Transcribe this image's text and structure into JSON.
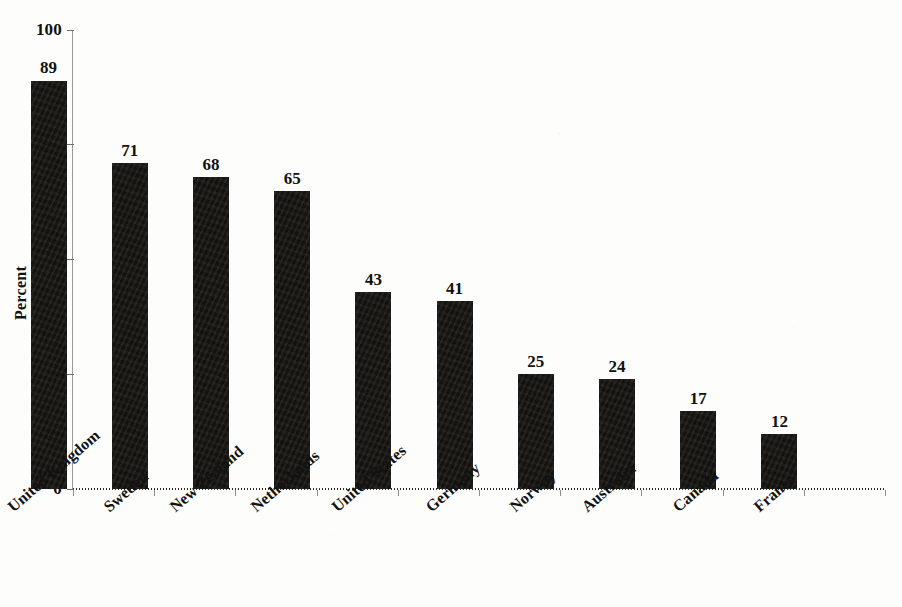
{
  "chart_data": {
    "type": "bar",
    "title": "",
    "subtitle": "",
    "xlabel": "",
    "ylabel": "Percent",
    "ylim": [
      0,
      100
    ],
    "grid": false,
    "legend": null,
    "orientation": "vertical",
    "bar_color": "#14120f",
    "categories": [
      "United Kingdom",
      "Sweden",
      "New Zealand",
      "Netherlands",
      "United States",
      "Germany",
      "Norway",
      "Australia",
      "Canada",
      "France"
    ],
    "values": [
      89,
      71,
      68,
      65,
      43,
      41,
      25,
      24,
      17,
      12
    ],
    "value_labels": [
      "89",
      "71",
      "68",
      "65",
      "43",
      "41",
      "25",
      "24",
      "17",
      "12"
    ],
    "y_ticks": [
      0,
      25,
      50,
      75,
      100
    ],
    "y_tick_labels": [
      "0",
      "25",
      "50",
      "75",
      "100"
    ]
  },
  "axis": {
    "y_title": "Percent",
    "y_tick_labels": [
      "100",
      "75",
      "50",
      "25",
      "0"
    ]
  }
}
